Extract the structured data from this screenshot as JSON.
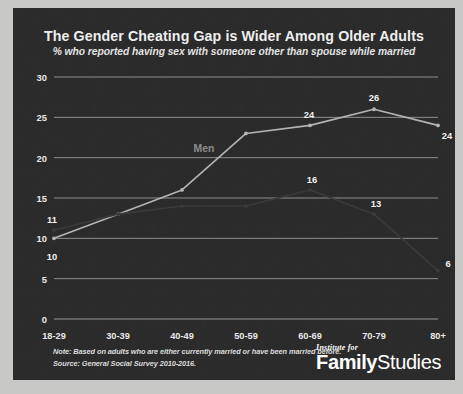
{
  "chart_data": {
    "type": "line",
    "title": "The Gender Cheating Gap is Wider Among Older Adults",
    "subtitle": "% who reported having sex with someone other than spouse while married",
    "xlabel": "",
    "ylabel": "",
    "ylim": [
      0,
      30
    ],
    "yticks": [
      0,
      5,
      10,
      15,
      20,
      25,
      30
    ],
    "grid": true,
    "legend_position": "inline",
    "categories": [
      "18-29",
      "30-39",
      "40-49",
      "50-59",
      "60-69",
      "70-79",
      "80+"
    ],
    "series": [
      {
        "name": "Men",
        "color": "#b4b4b4",
        "values": [
          10,
          13,
          16,
          23,
          24,
          26,
          24
        ],
        "labels": [
          "10",
          "",
          "",
          "",
          "24",
          "26",
          "24"
        ]
      },
      {
        "name": "Women",
        "color": "#3a3a3a",
        "values": [
          11,
          13,
          14,
          14,
          16,
          13,
          6
        ],
        "labels": [
          "11",
          "",
          "",
          "",
          "16",
          "13",
          "6"
        ]
      }
    ],
    "annotations": [
      {
        "text": "Men",
        "x_index": 3,
        "value": 21.2,
        "kind": "series-label"
      }
    ]
  },
  "footer": {
    "note_line1": "Note: Based on adults who are either currently married or have been married before.",
    "note_line2": "Source: General Social Survey 2010-2016."
  },
  "logo": {
    "top": "Institute for",
    "bold": "Family",
    "light": "Studies"
  }
}
